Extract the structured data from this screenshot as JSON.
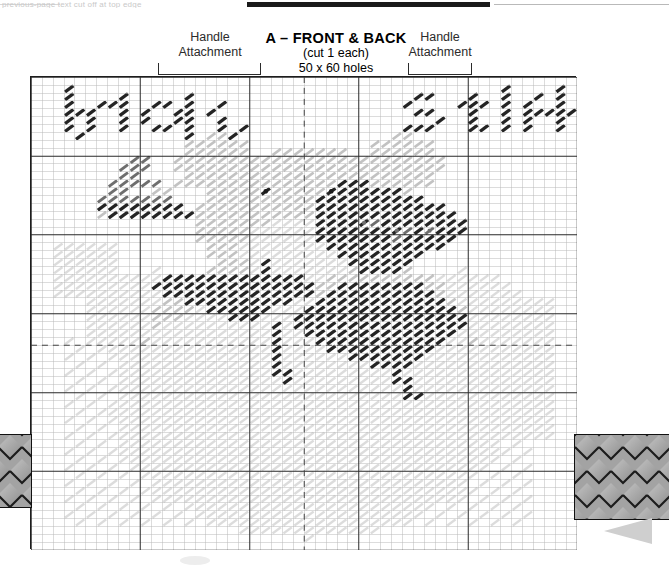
{
  "document": {
    "type": "plastic-canvas-stitch-chart",
    "top_artifact_text": "previous-page text cut off at top edge"
  },
  "header": {
    "title": "A – FRONT & BACK",
    "subtitle_cut": "(cut 1 each)",
    "subtitle_size": "50 x 60 holes",
    "handle_left_line1": "Handle",
    "handle_left_line2": "Attachment",
    "handle_right_line1": "Handle",
    "handle_right_line2": "Attachment"
  },
  "chart_data": {
    "type": "heatmap",
    "title": "A – FRONT & BACK",
    "subtitle": "(cut 1 each) 50 x 60 holes",
    "xlabel": "",
    "ylabel": "",
    "grid": true,
    "cols": 50,
    "rows": 60,
    "cell_px": 10.85,
    "legend_position": "none",
    "bold_grid_every": 10,
    "dashed_center_col": 25,
    "dashed_center_row": 34,
    "colors": {
      "background": "#ffffff",
      "grid_light": "#b9b9b9",
      "grid_bold": "#2a2a2a",
      "stitch_dark": "#242424",
      "stitch_mid": "#6e6e6e",
      "stitch_light": "#c2c2c2",
      "stitch_pale": "#dcdcdc",
      "eye": "#1a1a1a",
      "outline": "#1d1d1d"
    },
    "legend_entries": [
      {
        "name": "dark",
        "swatch": "#242424",
        "meaning": "black / dark brown yarn"
      },
      {
        "name": "medium",
        "swatch": "#6e6e6e",
        "meaning": "medium shade yarn"
      },
      {
        "name": "light",
        "swatch": "#c2c2c2",
        "meaning": "light background yarn"
      },
      {
        "name": "pale",
        "swatch": "#dcdcdc",
        "meaning": "palest fill yarn"
      }
    ],
    "annotations": [
      {
        "text": "baby's",
        "kind": "stitched-lettering",
        "col": 2,
        "row": 1,
        "shade": "dark"
      },
      {
        "text": "stuff",
        "kind": "stitched-lettering",
        "col": 34,
        "row": 1,
        "shade": "dark"
      },
      {
        "text": "teddy bear motif",
        "kind": "picture",
        "col": 12,
        "row": 9,
        "shade": "mixed"
      },
      {
        "text": "handle attachment bracket left",
        "col": 12,
        "row": -1
      },
      {
        "text": "handle attachment bracket right",
        "col": 35,
        "row": -1
      }
    ],
    "text_rows": {
      "baby_word": "baby's",
      "stuff_word": "stuff"
    }
  },
  "side_tabs": {
    "left_label": "quilted handle tab left",
    "right_label": "quilted handle tab right",
    "pattern": "diamond-quilt",
    "fill": "#9d9d9d"
  },
  "arrow": {
    "name": "page-turn-arrow",
    "direction": "left",
    "color": "#cfcfcf"
  }
}
